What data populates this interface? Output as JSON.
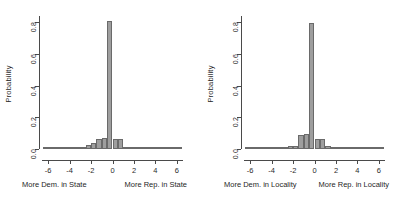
{
  "figure": {
    "background": "#ffffff",
    "bar_fill": "#9e9e9e",
    "bar_stroke": "#6a6a6a",
    "axis_color": "#4a4a4a"
  },
  "panels": [
    {
      "id": "left",
      "ytitle": "Probability",
      "caption_left": "More Dem. in State",
      "caption_right": "More Rep. in State"
    },
    {
      "id": "right",
      "ytitle": "Probability",
      "caption_left": "More Dem. in Locality",
      "caption_right": "More Rep. in Locality"
    }
  ],
  "axes": {
    "yticks": [
      "0.0",
      "0.2",
      "0.4",
      "0.6",
      "0.8"
    ],
    "ytick_values": [
      0.0,
      0.2,
      0.4,
      0.6,
      0.8
    ],
    "xticks": [
      "-6",
      "-4",
      "-2",
      "0",
      "2",
      "4",
      "6"
    ],
    "xtick_values": [
      -6,
      -4,
      -2,
      0,
      2,
      4,
      6
    ],
    "xlim": [
      -6.75,
      6.75
    ],
    "ylim": [
      0,
      0.84
    ]
  },
  "chart_data": [
    {
      "type": "bar",
      "title": "",
      "subtitle": "",
      "xlabel": "More Dem. in State / More Rep. in State",
      "ylabel": "Probability",
      "xlim": [
        -6.75,
        6.75
      ],
      "ylim": [
        0,
        0.84
      ],
      "grid": false,
      "legend": "none",
      "bin_width": 0.5,
      "annotations": [
        "More Dem. in State",
        "More Rep. in State"
      ],
      "x": [
        -6.25,
        -5.75,
        -5.25,
        -4.75,
        -4.25,
        -3.75,
        -3.25,
        -2.75,
        -2.25,
        -1.75,
        -1.25,
        -0.75,
        -0.25,
        0.25,
        0.75,
        1.25,
        1.75,
        2.25,
        2.75,
        3.25,
        3.75,
        4.25,
        4.75,
        5.25,
        5.75,
        6.25
      ],
      "values": [
        0.004,
        0.003,
        0.003,
        0.004,
        0.005,
        0.006,
        0.012,
        0.013,
        0.026,
        0.04,
        0.065,
        0.068,
        0.81,
        0.065,
        0.064,
        0.012,
        0.006,
        0.005,
        0.004,
        0.004,
        0.003,
        0.003,
        0.004,
        0.003,
        0.003,
        0.005
      ]
    },
    {
      "type": "bar",
      "title": "",
      "subtitle": "",
      "xlabel": "More Dem. in Locality / More Rep. in Locality",
      "ylabel": "Probability",
      "xlim": [
        -6.75,
        6.75
      ],
      "ylim": [
        0,
        0.84
      ],
      "grid": false,
      "legend": "none",
      "bin_width": 0.5,
      "annotations": [
        "More Dem. in Locality",
        "More Rep. in Locality"
      ],
      "x": [
        -6.25,
        -5.75,
        -5.25,
        -4.75,
        -4.25,
        -3.75,
        -3.25,
        -2.75,
        -2.25,
        -1.75,
        -1.25,
        -0.75,
        -0.25,
        0.25,
        0.75,
        1.25,
        1.75,
        2.25,
        2.75,
        3.25,
        3.75,
        4.25,
        4.75,
        5.25,
        5.75,
        6.25
      ],
      "values": [
        0.003,
        0.003,
        0.003,
        0.004,
        0.004,
        0.005,
        0.01,
        0.012,
        0.022,
        0.022,
        0.09,
        0.092,
        0.795,
        0.066,
        0.065,
        0.016,
        0.01,
        0.005,
        0.004,
        0.003,
        0.003,
        0.003,
        0.004,
        0.004,
        0.01,
        0.011
      ]
    }
  ]
}
